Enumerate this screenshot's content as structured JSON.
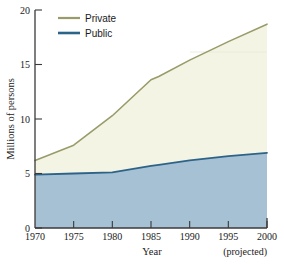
{
  "chart_data": {
    "type": "area",
    "title": "",
    "xlabel": "Year",
    "ylabel": "Millions of persons",
    "xlim": [
      1970,
      2000
    ],
    "ylim": [
      0,
      20
    ],
    "grid": false,
    "stacked": true,
    "legend_position": "top-left",
    "x_tick_labels": [
      "1970",
      "1975",
      "1980",
      "1985",
      "1990",
      "1995",
      "2000"
    ],
    "x_ticks": [
      1970,
      1975,
      1980,
      1985,
      1990,
      1995,
      2000
    ],
    "y_tick_labels": [
      "0",
      "5",
      "10",
      "15",
      "20"
    ],
    "y_ticks": [
      0,
      5,
      10,
      15,
      20
    ],
    "annotation": "(projected)",
    "x": [
      1970,
      1975,
      1980,
      1985,
      1986,
      1990,
      1995,
      2000
    ],
    "series": [
      {
        "name": "Public",
        "color": "#2e6389",
        "fill": "#a6c0d4",
        "values": [
          4.9,
          5.0,
          5.1,
          5.7,
          5.8,
          6.2,
          6.6,
          6.9
        ]
      },
      {
        "name": "Private",
        "color": "#9a9b6a",
        "fill": "#f3f4e3",
        "values": [
          6.2,
          7.6,
          10.3,
          13.6,
          13.9,
          15.4,
          17.1,
          18.7
        ],
        "note": "cumulative top boundary of stacked area"
      }
    ],
    "legend": [
      {
        "label": "Private",
        "color": "#9a9b6a"
      },
      {
        "label": "Public",
        "color": "#2e6389"
      }
    ]
  },
  "axes": {
    "y_label": "Millions of persons",
    "x_label": "Year",
    "projected_note": "(projected)"
  },
  "icons": {
    "legend_swatch": "line-swatch-icon"
  }
}
